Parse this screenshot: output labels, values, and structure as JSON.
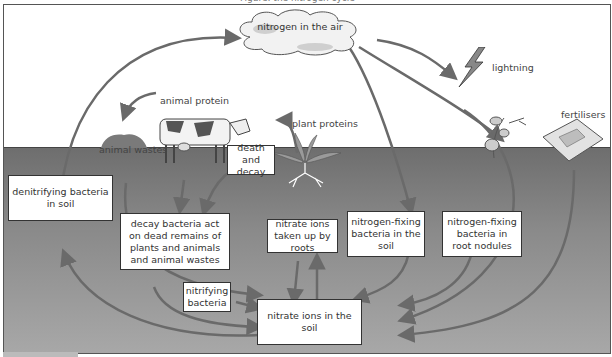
{
  "title_strip": "Figure: the nitrogen cycle",
  "colors": {
    "arrow": "#6a6a6a",
    "soil_top": "#6e6e6e",
    "soil_bottom": "#a8a8a8",
    "box_border": "#333333",
    "text": "#333333"
  },
  "nodes": {
    "air": "nitrogen in the air",
    "lightning": "lightning",
    "fertilisers": "fertilisers",
    "animal_protein": "animal protein",
    "animal_wastes": "animal wastes",
    "plant_proteins": "plant proteins",
    "death_decay": "death and decay",
    "denitrifying": "denitrifying bacteria in soil",
    "decay_bacteria": "decay bacteria act on dead remains of plants and animals and animal wastes",
    "nitrate_roots": "nitrate ions taken up by roots",
    "nfix_soil": "nitrogen-fixing bacteria in the soil",
    "nfix_nodules": "nitrogen-fixing bacteria in root nodules",
    "nitrifying": "nitrifying bacteria",
    "nitrate_soil": "nitrate ions in the soil"
  },
  "icons": {
    "cloud": "cloud-icon",
    "lightning": "lightning-bolt-icon",
    "cow": "cow-icon",
    "plant": "grass-plant-icon",
    "legume": "legume-plant-icon",
    "fertiliser_bag": "fertiliser-bag-icon",
    "waste_mound": "dung-mound-icon"
  }
}
